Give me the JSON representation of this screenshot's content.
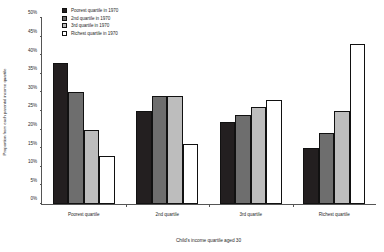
{
  "chart_data": {
    "type": "bar",
    "title": "",
    "xlabel": "Child's income quartile aged 30",
    "ylabel": "Proportion from each parental income quartile",
    "categories": [
      "Poorest quartile",
      "2nd quartile",
      "3rd quartile",
      "Richest quartile"
    ],
    "series": [
      {
        "name": "Poorest quartile in 1970",
        "values": [
          38,
          25,
          22,
          15
        ],
        "color": "#231f20"
      },
      {
        "name": "2nd quartile in 1970",
        "values": [
          30,
          29,
          24,
          19
        ],
        "color": "#6e6e6e"
      },
      {
        "name": "3rd quartile in 1970",
        "values": [
          20,
          29,
          26,
          25
        ],
        "color": "#bdbdbd"
      },
      {
        "name": "Richest quartile in 1970",
        "values": [
          13,
          16,
          28,
          43
        ],
        "color": "#ffffff"
      }
    ],
    "ylim": [
      0,
      50
    ],
    "yticks": [
      0,
      5,
      10,
      15,
      20,
      25,
      30,
      35,
      40,
      45,
      50
    ],
    "ytick_labels": [
      "0%",
      "5%",
      "10%",
      "15%",
      "20%",
      "25%",
      "30%",
      "35%",
      "40%",
      "45%",
      "50%"
    ],
    "grid": false,
    "legend_position": "top-left-inside",
    "axis_color": "#555555",
    "bar_border_color": "#111111"
  }
}
